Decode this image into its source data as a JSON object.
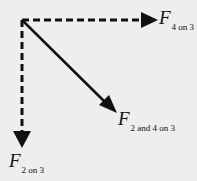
{
  "diagram": {
    "title": "",
    "vectors": [
      {
        "id": "f4on3",
        "symbol": "F",
        "subscript": "4 on 3",
        "style": "dashed",
        "direction": "right"
      },
      {
        "id": "f2and4on3",
        "symbol": "F",
        "subscript": "2 and 4 on 3",
        "style": "solid",
        "direction": "down-right"
      },
      {
        "id": "f2on3",
        "symbol": "F",
        "subscript": "2 on 3",
        "style": "dashed",
        "direction": "down"
      }
    ],
    "colors": {
      "background": "#efeeec",
      "ink": "#111111"
    }
  }
}
